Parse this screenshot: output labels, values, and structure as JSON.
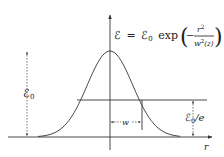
{
  "diagram": {
    "equation": {
      "lhs": "ℰ",
      "equals": "=",
      "amplitude": "ℰ",
      "amplitude_sub": "0",
      "func": "exp",
      "minus": "−",
      "numerator": "r",
      "numerator_sup": "2",
      "denominator": "w",
      "denominator_sup": "2",
      "denominator_arg": "(z)"
    },
    "labels": {
      "peak_amplitude": "ℰ",
      "peak_amplitude_sub": "0",
      "one_over_e": "ℰ",
      "one_over_e_sub": "0",
      "one_over_e_suffix": "/e",
      "beam_radius": "w",
      "x_axis": "r"
    },
    "curve": {
      "type": "gaussian",
      "peak": 1.0,
      "level_marked": "1/e"
    },
    "colors": {
      "stroke": "#333333",
      "background": "#ffffff"
    }
  }
}
